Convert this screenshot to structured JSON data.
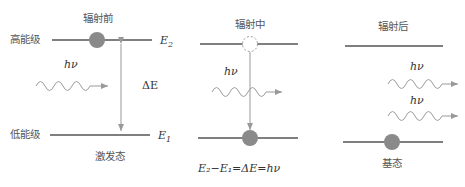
{
  "panels": [
    {
      "title": "辐射前",
      "upper_level_label": "高能级",
      "lower_level_label": "低能级",
      "upper_energy": "E",
      "upper_energy_sub": "2",
      "lower_energy": "E",
      "lower_energy_sub": "1",
      "gap_label": "ΔE",
      "photon_label": "hν",
      "state_label": "激发态"
    },
    {
      "title": "辐射中",
      "photon_label": "hν",
      "equation": "E₂−E₁=ΔE=hν"
    },
    {
      "title": "辐射后",
      "photon_labels": [
        "hν",
        "hν"
      ],
      "state_label": "基态"
    }
  ],
  "colors": {
    "line": "#555555",
    "electron": "#8a8a8a",
    "wave": "#9a9a9a",
    "arrow": "#999999"
  }
}
